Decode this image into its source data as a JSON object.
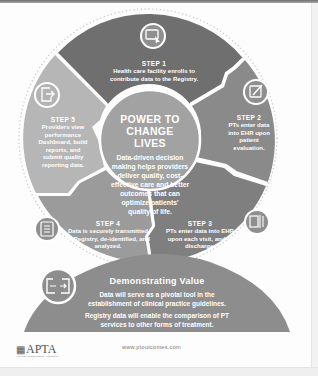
{
  "colors": {
    "step1": "#6f6f6f",
    "step2": "#8a8a8a",
    "step3": "#7f7f7f",
    "step4": "#9b9b9b",
    "step5": "#b6b6b6",
    "center": "#a2a2a2",
    "banner": "#8d8d8d",
    "icon_bg": "#8f8f8f",
    "dots": "#c8c8c8"
  },
  "center": {
    "title_line1": "POWER TO",
    "title_line2": "CHANGE LIVES",
    "description": "Data-driven decision making helps providers deliver quality, cost-effective care and better outcomes that can optimize patients' quality of life."
  },
  "steps": [
    {
      "title": "STEP 1",
      "description": "Health care facility enrolls to contribute data to the Registry.",
      "icon": "computer-cursor-icon"
    },
    {
      "title": "STEP 2",
      "description": "PTs enter data into EHR upon patient evaluation.",
      "icon": "edit-form-icon"
    },
    {
      "title": "STEP 3",
      "description": "PTs enter data into EHR upon each visit, and at discharge.",
      "icon": "documents-icon"
    },
    {
      "title": "STEP 4",
      "description": "Data is securely transmitted to Registry, de-identified, and analyzed.",
      "icon": "list-document-icon"
    },
    {
      "title": "STEP 5",
      "description": "Providers view performance Dashboard, build reports, and submit quality reporting data.",
      "icon": "export-icon"
    }
  ],
  "banner": {
    "title": "Demonstrating Value",
    "paragraph1": "Data will serve as a pivotal tool in the establishment of clinical practice guidelines.",
    "paragraph2": "Registry data will enable the comparison of PT services to other forms of treatment.",
    "icon": "data-exchange-icon"
  },
  "footer": {
    "logo_text": "APTA",
    "logo_tagline": "American Physical Therapy Association",
    "url": "www.ptoutcomes.com"
  }
}
